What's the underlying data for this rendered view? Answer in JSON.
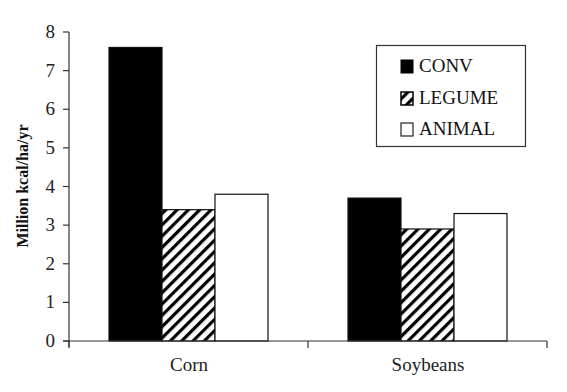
{
  "chart_data": {
    "type": "bar",
    "title": "",
    "xlabel": "",
    "ylabel": "Million kcal/ha/yr",
    "ylim": [
      0,
      8
    ],
    "yticks": [
      0,
      1,
      2,
      3,
      4,
      5,
      6,
      7,
      8
    ],
    "grid": false,
    "legend_position": "upper right (boxed)",
    "categories": [
      "Corn",
      "Soybeans"
    ],
    "series": [
      {
        "name": "CONV",
        "values": [
          7.6,
          3.7
        ],
        "fill": "solid",
        "color": "#000000"
      },
      {
        "name": "LEGUME",
        "values": [
          3.4,
          2.9
        ],
        "fill": "diagonal-hatch",
        "color": "#000000"
      },
      {
        "name": "ANIMAL",
        "values": [
          3.8,
          3.3
        ],
        "fill": "none",
        "color": "#ffffff"
      }
    ]
  },
  "legend": {
    "items": [
      {
        "label": "CONV"
      },
      {
        "label": "LEGUME"
      },
      {
        "label": "ANIMAL"
      }
    ]
  },
  "axis": {
    "ylabel": "Million kcal/ha/yr",
    "categories": [
      "Corn",
      "Soybeans"
    ],
    "yticks": [
      "0",
      "1",
      "2",
      "3",
      "4",
      "5",
      "6",
      "7",
      "8"
    ]
  },
  "colors": {
    "axis": "#333333",
    "bar_outline": "#111111",
    "background": "#ffffff"
  }
}
